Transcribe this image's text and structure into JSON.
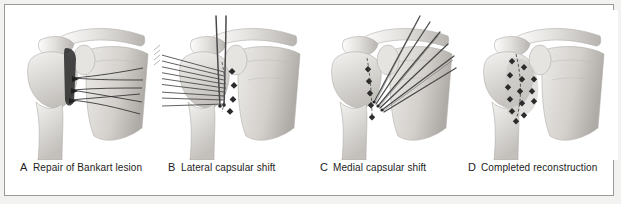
{
  "figure": {
    "border_color": "#9a9a9a",
    "background_color": "#ffffff",
    "outer_background_color": "#f2f2f0",
    "ink_color": "#1c1c1c",
    "bone_light": "#f0efee",
    "bone_mid": "#cfcdca",
    "bone_shadow": "#a9a6a2",
    "suture_color": "#3a3a3a"
  },
  "panels": [
    {
      "letter": "A",
      "caption": "Repair of Bankart lesion",
      "name": "panel-repair-of-bankart-lesion",
      "anatomy": [
        "clavicle",
        "acromion",
        "coracoid",
        "humeral head",
        "humerus shaft",
        "scapula",
        "glenoid"
      ],
      "features": [
        "capsular incision",
        "anchor sutures",
        "suture strands"
      ],
      "suture_count": 4,
      "suture_direction": "right"
    },
    {
      "letter": "B",
      "caption": "Lateral capsular shift",
      "name": "panel-lateral-capsular-shift",
      "anatomy": [
        "clavicle",
        "acromion",
        "coracoid",
        "humeral head",
        "humerus shaft",
        "scapula",
        "glenoid"
      ],
      "features": [
        "vertical needles",
        "suture fan",
        "knot column"
      ],
      "suture_count": 9,
      "suture_direction": "upper-left"
    },
    {
      "letter": "C",
      "caption": "Medial capsular shift",
      "name": "panel-medial-capsular-shift",
      "anatomy": [
        "clavicle",
        "acromion",
        "coracoid",
        "humeral head",
        "humerus shaft",
        "scapula",
        "glenoid"
      ],
      "features": [
        "suture fan",
        "needles",
        "knot column"
      ],
      "suture_count": 6,
      "suture_direction": "upper-right"
    },
    {
      "letter": "D",
      "caption": "Completed reconstruction",
      "name": "panel-completed-reconstruction",
      "anatomy": [
        "clavicle",
        "acromion",
        "coracoid",
        "humeral head",
        "humerus shaft",
        "scapula",
        "glenoid"
      ],
      "features": [
        "completed suture knots",
        "repaired capsule"
      ],
      "knot_count": 14,
      "suture_direction": "none"
    }
  ]
}
